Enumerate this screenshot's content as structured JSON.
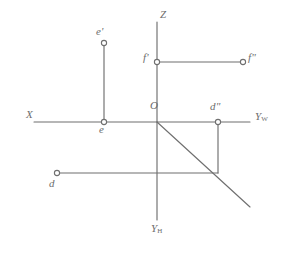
{
  "figure": {
    "type": "descriptive-geometry-projection",
    "background_color": "#ffffff",
    "line_color": "#6f6f6f",
    "label_color": "#6d6d6d",
    "width": 290,
    "height": 261
  },
  "axes": {
    "x_axis": {
      "label": "X",
      "label_x": 26,
      "label_y": 115,
      "from": [
        34,
        122
      ],
      "to": [
        250,
        122
      ]
    },
    "z_axis": {
      "label": "Z",
      "label_x": 160,
      "label_y": 14,
      "from": [
        157,
        22
      ],
      "to": [
        157,
        122
      ]
    },
    "yw_axis": {
      "label": "Y",
      "sub": "W",
      "label_x": 255,
      "label_y": 116,
      "from": [
        157,
        122
      ],
      "to": [
        250,
        122
      ]
    },
    "yh_axis": {
      "label": "Y",
      "sub": "H",
      "label_x": 151,
      "label_y": 228,
      "from": [
        157,
        122
      ],
      "to": [
        157,
        220
      ]
    },
    "origin": {
      "label": "O",
      "label_x": 151,
      "label_y": 104,
      "x": 157,
      "y": 122
    }
  },
  "bisector": {
    "from": [
      157,
      122
    ],
    "to": [
      250,
      207
    ]
  },
  "points": [
    {
      "name": "e-prime",
      "label": "e'",
      "x": 104,
      "y": 43,
      "label_x": 96,
      "label_y": 30,
      "label_anchor": "above-left"
    },
    {
      "name": "e",
      "label": "e",
      "x": 104,
      "y": 122,
      "label_x": 99,
      "label_y": 127,
      "label_anchor": "below-left"
    },
    {
      "name": "f-prime",
      "label": "f'",
      "x": 157,
      "y": 62,
      "label_x": 143,
      "label_y": 55,
      "label_anchor": "left"
    },
    {
      "name": "f-double-prime",
      "label": "f\"",
      "x": 243,
      "y": 62,
      "label_x": 248,
      "label_y": 55,
      "label_anchor": "right"
    },
    {
      "name": "d-double-prime",
      "label": "d\"",
      "x": 218,
      "y": 122,
      "label_x": 211,
      "label_y": 104,
      "label_anchor": "above"
    },
    {
      "name": "d",
      "label": "d",
      "x": 57,
      "y": 173,
      "label_x": 49,
      "label_y": 180,
      "label_anchor": "below-left"
    }
  ],
  "segments": [
    {
      "name": "e-projection-connector",
      "from": [
        104,
        43
      ],
      "to": [
        104,
        122
      ]
    },
    {
      "name": "f-projection-connector",
      "from": [
        157,
        62
      ],
      "to": [
        243,
        62
      ]
    },
    {
      "name": "d-horizontal-connector",
      "from": [
        57,
        173
      ],
      "to": [
        218,
        173
      ]
    },
    {
      "name": "d-vertical-connector",
      "from": [
        218,
        173
      ],
      "to": [
        218,
        122
      ]
    }
  ]
}
